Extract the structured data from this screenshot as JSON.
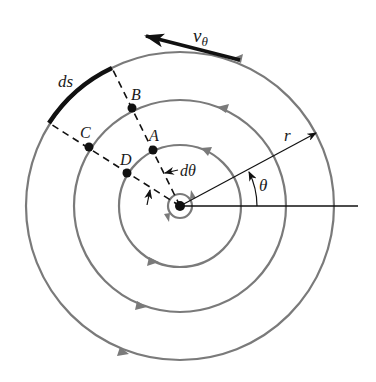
{
  "diagram": {
    "center": {
      "x": 180,
      "y": 206
    },
    "circles": [
      {
        "name": "core",
        "r": 12
      },
      {
        "name": "inner",
        "r": 61
      },
      {
        "name": "middle",
        "r": 106
      },
      {
        "name": "outer",
        "r": 154
      }
    ],
    "colors": {
      "streamline": "#7a7a7a",
      "ink": "#111111"
    },
    "labels": {
      "v_theta": "v",
      "v_theta_sub": "θ",
      "ds": "ds",
      "A": "A",
      "B": "B",
      "C": "C",
      "D": "D",
      "d_theta": "dθ",
      "r": "r",
      "theta": "θ"
    },
    "points": {
      "A": {
        "x": 153,
        "y": 150
      },
      "B": {
        "x": 132,
        "y": 108
      },
      "C": {
        "x": 89,
        "y": 147
      },
      "D": {
        "x": 127,
        "y": 173
      }
    }
  }
}
